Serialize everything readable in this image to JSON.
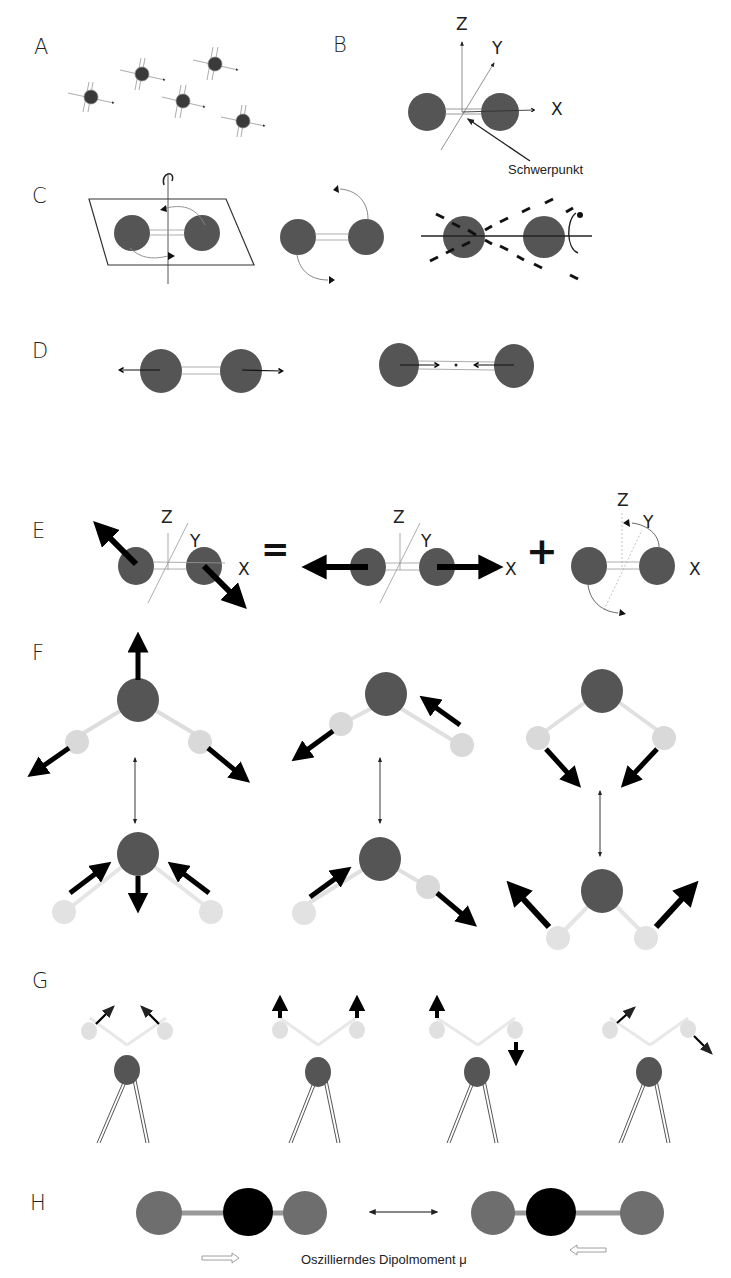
{
  "figure": {
    "colors": {
      "atom_dark": "#555555",
      "atom_light": "#d9d9d9",
      "atom_black": "#000000",
      "atom_mid": "#6e6e6e",
      "bond_gray": "#999999",
      "arrow": "#000000",
      "line": "#333333"
    },
    "panels": {
      "A": {
        "label": "A",
        "description": "five single atoms with small axis arrows"
      },
      "B": {
        "label": "B",
        "axis_z": "Z",
        "axis_y": "Y",
        "axis_x": "X",
        "annotation": "Schwerpunkt"
      },
      "C": {
        "label": "C",
        "description": "three rotation modes of a diatomic molecule"
      },
      "D": {
        "label": "D",
        "description": "stretching vibration, expanded and compressed"
      },
      "E": {
        "label": "E",
        "left": {
          "z": "Z",
          "y": "Y",
          "x": "X"
        },
        "equals": "=",
        "middle": {
          "z": "Z",
          "y": "Y",
          "x": "X"
        },
        "plus": "+",
        "right": {
          "z": "Z",
          "y": "Y",
          "x": "X"
        }
      },
      "F": {
        "label": "F",
        "description": "three normal modes of a triatomic bent molecule"
      },
      "G": {
        "label": "G",
        "description": "four bending/wagging modes of a surface-bound group"
      },
      "H": {
        "label": "H",
        "caption": "Oszillierndes Dipolmoment μ"
      }
    }
  }
}
